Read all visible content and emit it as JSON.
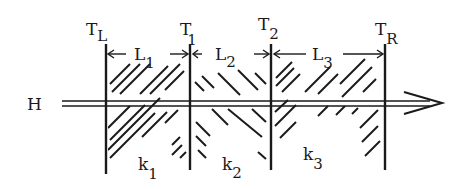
{
  "diagram": {
    "flux_label": "H",
    "boundaries": [
      {
        "main": "T",
        "sub": "L"
      },
      {
        "main": "T",
        "sub": "1"
      },
      {
        "main": "T",
        "sub": "2"
      },
      {
        "main": "T",
        "sub": "R"
      }
    ],
    "lengths": [
      {
        "main": "L",
        "sub": "1"
      },
      {
        "main": "L",
        "sub": "2"
      },
      {
        "main": "L",
        "sub": "3"
      }
    ],
    "conductivities": [
      {
        "main": "k",
        "sub": "1"
      },
      {
        "main": "k",
        "sub": "2"
      },
      {
        "main": "k",
        "sub": "3"
      }
    ],
    "ink_color": "#1a1a1a"
  }
}
